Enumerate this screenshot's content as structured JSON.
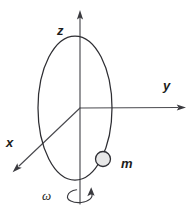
{
  "figure": {
    "background_color": "#ffffff",
    "stroke_color": "#2e2e33",
    "width": 191,
    "height": 221
  },
  "axes": [
    {
      "id": "z",
      "label": "z",
      "direction": "up",
      "origin": [
        80,
        108
      ],
      "tip": [
        80,
        10
      ],
      "arrowhead": true
    },
    {
      "id": "y",
      "label": "y",
      "direction": "right",
      "origin": [
        80,
        108
      ],
      "tip": [
        185,
        107
      ],
      "arrowhead": true
    },
    {
      "id": "x",
      "label": "x",
      "direction": "down-left (toward viewer)",
      "origin": [
        80,
        108
      ],
      "tip": [
        14,
        171
      ],
      "arrowhead": true
    }
  ],
  "loop": {
    "name": "vertical-circular-loop",
    "shape": "ellipse",
    "center": [
      75,
      108
    ],
    "rx": 37,
    "ry": 72,
    "fill": "none"
  },
  "mass": {
    "label": "m",
    "center": [
      103,
      159
    ],
    "radius": 7.5,
    "fill_color": "#e8e8e8",
    "stroke_color": "#2e2e33"
  },
  "rotation": {
    "label": "ω",
    "symbol_name": "omega",
    "about_axis": "z",
    "indicator_center": [
      80,
      197
    ],
    "indicator_rx": 12,
    "indicator_ry": 7,
    "arrowhead": true
  },
  "labels": {
    "z": "z",
    "y": "y",
    "x": "x",
    "m": "m",
    "omega": "ω"
  }
}
